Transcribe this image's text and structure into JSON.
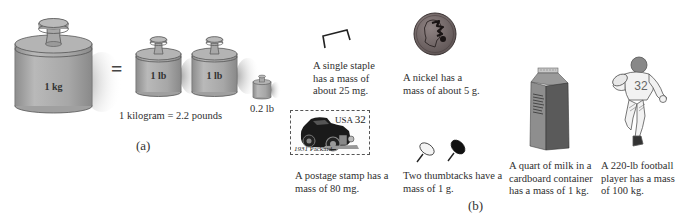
{
  "panel_a": {
    "label": "(a)",
    "weights": [
      {
        "name": "kilogram-weight",
        "label": "1 kg"
      },
      {
        "name": "pound-weight-1",
        "label": "1 lb"
      },
      {
        "name": "pound-weight-2",
        "label": "1 lb"
      },
      {
        "name": "small-weight",
        "label": "0.2 lb"
      }
    ],
    "equals": "=",
    "equation": "1 kilogram = 2.2 pounds"
  },
  "panel_b": {
    "label": "(b)",
    "items": [
      {
        "name": "staple",
        "lines": [
          "A single staple",
          "has a mass of",
          "about 25 mg."
        ]
      },
      {
        "name": "nickel",
        "lines": [
          "A nickel has a",
          "mass of about 5 g."
        ]
      },
      {
        "name": "postage-stamp",
        "lines": [
          "A postage stamp has a",
          "mass of 80 mg."
        ],
        "stamp_country": "USA",
        "stamp_value": "32",
        "stamp_year": "1931",
        "stamp_caption": "Packard"
      },
      {
        "name": "thumbtacks",
        "lines": [
          "Two thumbtacks have a",
          "mass of 1 g."
        ]
      },
      {
        "name": "milk-carton",
        "lines": [
          "A quart of milk in a",
          "cardboard container",
          "has a mass of 1 kg."
        ]
      },
      {
        "name": "football-player",
        "lines": [
          "A 220-lb football",
          "player has a mass",
          "of 100 kg."
        ],
        "jersey_number": "32"
      }
    ]
  }
}
